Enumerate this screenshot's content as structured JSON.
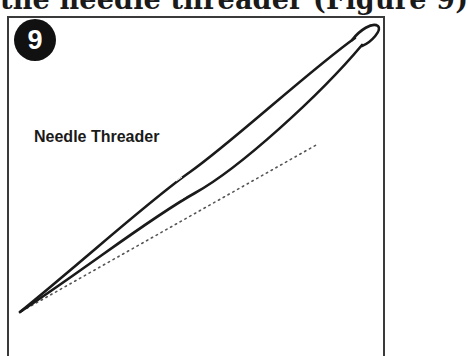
{
  "page": {
    "heading_fragment": "the needle threader (Figure 9)"
  },
  "figure": {
    "number": "9",
    "label": "Needle Threader",
    "illustration": "needle-threader-wire-loop",
    "colors": {
      "ink": "#1a1a1a",
      "badge_bg": "#111111",
      "badge_text": "#ffffff",
      "frame": "#3a3a3a",
      "dotted_line": "#555555"
    }
  }
}
